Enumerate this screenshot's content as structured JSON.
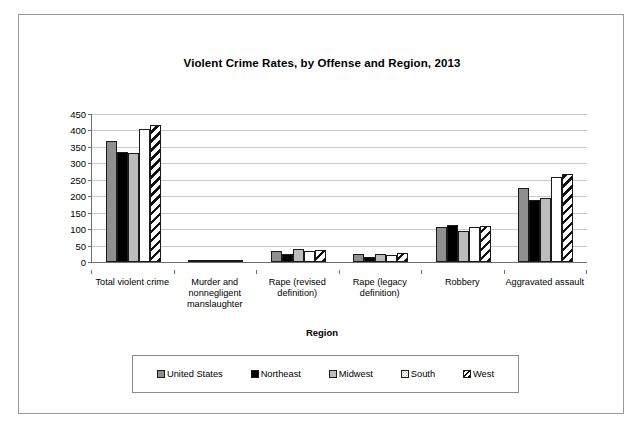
{
  "chart_data": {
    "type": "bar",
    "title": "Violent Crime Rates, by Offense and Region, 2013",
    "xlabel": "Region",
    "ylabel": "Rate per 100,000 population",
    "ylim": [
      0,
      450
    ],
    "ytick_step": 50,
    "yticks": [
      0,
      50,
      100,
      150,
      200,
      250,
      300,
      350,
      400,
      450
    ],
    "grid": true,
    "legend_position": "bottom",
    "categories": [
      "Total violent crime",
      "Murder and nonnegligent manslaughter",
      "Rape (revised definition)",
      "Rape (legacy definition)",
      "Robbery",
      "Aggravated assault"
    ],
    "series": [
      {
        "name": "United States",
        "pattern": "solid-dark-gray",
        "color": "#8f8f8f",
        "values": [
          368,
          4.5,
          33,
          23,
          105,
          225
        ]
      },
      {
        "name": "Northeast",
        "pattern": "solid-black",
        "color": "#000000",
        "values": [
          335,
          3.5,
          24,
          16,
          114,
          190
        ]
      },
      {
        "name": "Midwest",
        "pattern": "solid-light-gray",
        "color": "#bcbcbc",
        "values": [
          332,
          4.5,
          39,
          25,
          95,
          196
        ]
      },
      {
        "name": "South",
        "pattern": "dotted-white",
        "color": "#ffffff",
        "values": [
          404,
          5.3,
          34,
          22,
          105,
          258
        ]
      },
      {
        "name": "West",
        "pattern": "diagonal-hatch",
        "color": "#ffffff",
        "values": [
          418,
          4.3,
          38,
          27,
          108,
          268
        ]
      }
    ]
  },
  "legend": {
    "items": [
      {
        "label": "United States"
      },
      {
        "label": "Northeast"
      },
      {
        "label": "Midwest"
      },
      {
        "label": "South"
      },
      {
        "label": "West"
      }
    ]
  }
}
